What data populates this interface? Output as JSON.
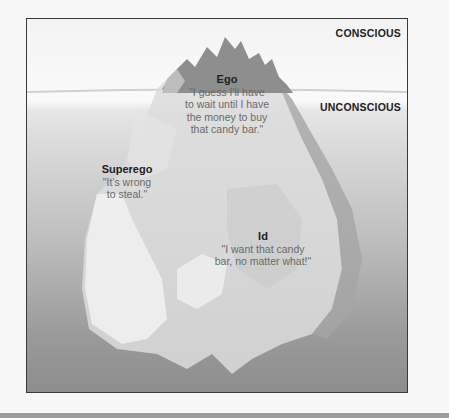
{
  "diagram": {
    "zones": {
      "conscious": "CONSCIOUS",
      "unconscious": "UNCONSCIOUS"
    },
    "parts": [
      {
        "name": "Ego",
        "quote_lines": [
          "\"I guess I'll have",
          "to wait until I have",
          "the money to buy",
          "that candy bar.\""
        ]
      },
      {
        "name": "Superego",
        "quote_lines": [
          "\"It's wrong",
          "to steal.\""
        ]
      },
      {
        "name": "Id",
        "quote_lines": [
          "\"I want that candy",
          "bar, no matter what!\""
        ]
      }
    ],
    "colors": {
      "above_water": "#f5f5f5",
      "deep_water": "#8d8d8d",
      "iceberg_tip": "#8a8a8a",
      "iceberg_light": "#e8e8e8",
      "frame_border": "#3a3a3a"
    }
  }
}
